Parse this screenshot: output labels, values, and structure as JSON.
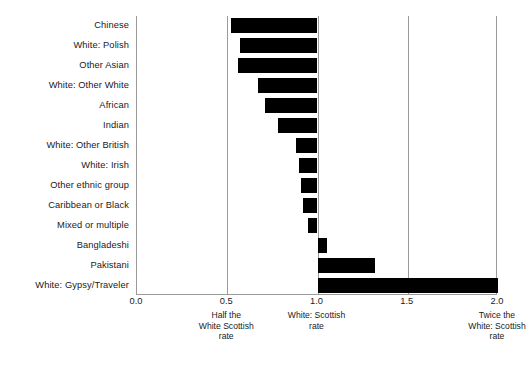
{
  "chart_data": {
    "type": "bar",
    "orientation": "horizontal",
    "title": "",
    "subtitle": "",
    "xlabel": "",
    "ylabel": "",
    "xlim": [
      0.0,
      2.0
    ],
    "grid": true,
    "legend": null,
    "baseline": 1.0,
    "note": "Bars are drawn from each group's rate to the White: Scottish reference rate of 1.0",
    "categories": [
      "Chinese",
      "White: Polish",
      "Other Asian",
      "White: Other White",
      "African",
      "Indian",
      "White: Other British",
      "White: Irish",
      "Other ethnic group",
      "Caribbean or Black",
      "Mixed or multiple",
      "Bangladeshi",
      "Pakistani",
      "White: Gypsy/Traveler"
    ],
    "values": [
      0.52,
      0.57,
      0.56,
      0.67,
      0.71,
      0.78,
      0.88,
      0.9,
      0.91,
      0.92,
      0.95,
      1.05,
      1.32,
      2.0
    ],
    "xticks": [
      {
        "value": 0.0,
        "label": "0.0",
        "note": ""
      },
      {
        "value": 0.5,
        "label": "0.5",
        "note": "Half the\nWhite Scottish\nrate"
      },
      {
        "value": 1.0,
        "label": "1.0",
        "note": "White: Scottish\nrate"
      },
      {
        "value": 1.5,
        "label": "1.5",
        "note": ""
      },
      {
        "value": 2.0,
        "label": "2.0",
        "note": "Twice the\nWhite: Scottish\nrate"
      }
    ],
    "colors": {
      "bar": "#000000",
      "axis": "#9b9b9b",
      "gridline": "#9b9b9b",
      "text": "#1a1a1a",
      "background": "#ffffff"
    }
  }
}
